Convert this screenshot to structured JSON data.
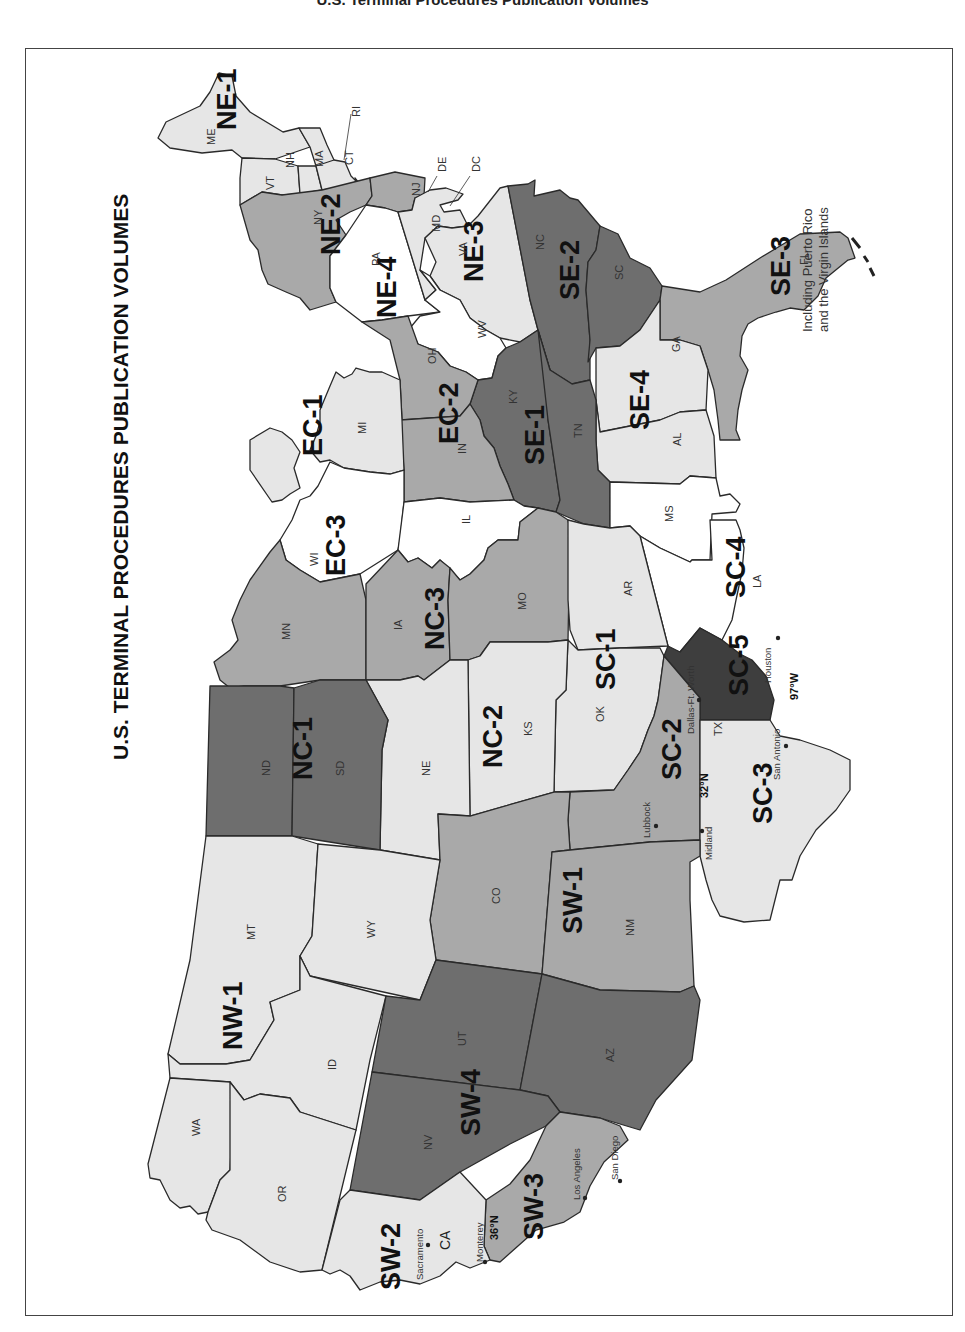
{
  "page_caption": "U.S. Terminal Procedures Publication Volumes",
  "map": {
    "title": "U.S. TERMINAL PROCEDURES PUBLICATION VOLUMES",
    "note_line1": "Including Puerto Rico",
    "note_line2": "and the Virgin Islands",
    "orientation": "rotated 90° counterclockwise (north at left)",
    "shades": {
      "light": "#e6e6e6",
      "medium": "#a9a9a9",
      "dark": "#6e6e6e",
      "very_dark": "#3e3e3e",
      "white": "#ffffff",
      "outline": "#2a2a2a"
    },
    "volumes": {
      "NE1": "NE-1",
      "NE2": "NE-2",
      "NE3": "NE-3",
      "NE4": "NE-4",
      "SE1": "SE-1",
      "SE2": "SE-2",
      "SE3": "SE-3",
      "SE4": "SE-4",
      "EC1": "EC-1",
      "EC2": "EC-2",
      "EC3": "EC-3",
      "NC1": "NC-1",
      "NC2": "NC-2",
      "NC3": "NC-3",
      "SC1": "SC-1",
      "SC2": "SC-2",
      "SC3": "SC-3",
      "SC4": "SC-4",
      "SC5": "SC-5",
      "SW1": "SW-1",
      "SW2": "SW-2",
      "SW3": "SW-3",
      "SW4": "SW-4",
      "NW1": "NW-1"
    },
    "states": {
      "ME": "ME",
      "VT": "VT",
      "NH": "NH",
      "MA": "MA",
      "CT": "CT",
      "RI": "RI",
      "NY": "NY",
      "NJ": "NJ",
      "PA": "PA",
      "DE": "DE",
      "DC": "DC",
      "MD": "MD",
      "VA": "VA",
      "WV": "WV",
      "NC": "NC",
      "SC": "SC",
      "GA": "GA",
      "FL": "FL",
      "AL": "AL",
      "MS": "MS",
      "TN": "TN",
      "KY": "KY",
      "OH": "OH",
      "IN": "IN",
      "MI": "MI",
      "IL": "IL",
      "WI": "WI",
      "MN": "MN",
      "IA": "IA",
      "MO": "MO",
      "AR": "AR",
      "LA": "LA",
      "ND": "ND",
      "SD": "SD",
      "NE": "NE",
      "KS": "KS",
      "OK": "OK",
      "TX": "TX",
      "MT": "MT",
      "WY": "WY",
      "CO": "CO",
      "NM": "NM",
      "ID": "ID",
      "UT": "UT",
      "AZ": "AZ",
      "WA": "WA",
      "OR": "OR",
      "NV": "NV",
      "CA": "CA"
    },
    "cities": {
      "dallas": "Dallas-Ft. Worth",
      "houston": "Houston",
      "san_antonio": "San Antonio",
      "lubbock": "Lubbock",
      "midland": "Midland",
      "sacramento": "Sacramento",
      "monterey": "Monterey",
      "los_angeles": "Los Angeles",
      "san_diego": "San Diego"
    },
    "dividers": {
      "tx_lat": "32°N",
      "tx_lon": "97°W",
      "ca_lat": "36°N"
    },
    "region_assignments": [
      {
        "volume": "NE-1",
        "states": [
          "ME",
          "VT",
          "NH",
          "MA",
          "CT",
          "RI"
        ],
        "shade": "light"
      },
      {
        "volume": "NE-2",
        "states": [
          "NY",
          "NJ"
        ],
        "shade": "medium"
      },
      {
        "volume": "NE-3",
        "states": [
          "DE",
          "DC",
          "MD",
          "VA"
        ],
        "shade": "light"
      },
      {
        "volume": "NE-4",
        "states": [
          "PA"
        ],
        "shade": "white"
      },
      {
        "volume": "EC-1",
        "states": [
          "MI"
        ],
        "shade": "light"
      },
      {
        "volume": "EC-2",
        "states": [
          "OH",
          "IN"
        ],
        "shade": "medium"
      },
      {
        "volume": "EC-3",
        "states": [
          "WI",
          "IL"
        ],
        "shade": "white"
      },
      {
        "volume": "SE-1",
        "states": [
          "KY",
          "TN"
        ],
        "shade": "dark"
      },
      {
        "volume": "SE-2",
        "states": [
          "NC",
          "SC"
        ],
        "shade": "dark"
      },
      {
        "volume": "SE-3",
        "states": [
          "FL"
        ],
        "shade": "medium"
      },
      {
        "volume": "SE-4",
        "states": [
          "GA",
          "AL"
        ],
        "shade": "light"
      },
      {
        "volume": "NC-1",
        "states": [
          "ND",
          "SD"
        ],
        "shade": "dark"
      },
      {
        "volume": "NC-2",
        "states": [
          "NE",
          "KS"
        ],
        "shade": "light"
      },
      {
        "volume": "NC-3",
        "states": [
          "MN",
          "IA",
          "MO"
        ],
        "shade": "medium"
      },
      {
        "volume": "SC-1",
        "states": [
          "OK",
          "AR"
        ],
        "shade": "light"
      },
      {
        "volume": "SC-2",
        "states": [
          "TX (north of 32°N, west of 97°W)"
        ],
        "shade": "medium"
      },
      {
        "volume": "SC-3",
        "states": [
          "TX (south of 32°N, west of 97°W)"
        ],
        "shade": "light"
      },
      {
        "volume": "SC-4",
        "states": [
          "MS",
          "LA"
        ],
        "shade": "white"
      },
      {
        "volume": "SC-5",
        "states": [
          "TX (east of 97°W)"
        ],
        "shade": "very_dark"
      },
      {
        "volume": "SW-1",
        "states": [
          "CO",
          "NM"
        ],
        "shade": "medium"
      },
      {
        "volume": "SW-2",
        "states": [
          "CA (north of 36°N)"
        ],
        "shade": "light"
      },
      {
        "volume": "SW-3",
        "states": [
          "CA (south of 36°N)"
        ],
        "shade": "medium"
      },
      {
        "volume": "SW-4",
        "states": [
          "NV",
          "UT",
          "AZ"
        ],
        "shade": "dark"
      },
      {
        "volume": "NW-1",
        "states": [
          "MT",
          "WY",
          "ID",
          "WA",
          "OR"
        ],
        "shade": "light"
      }
    ]
  }
}
